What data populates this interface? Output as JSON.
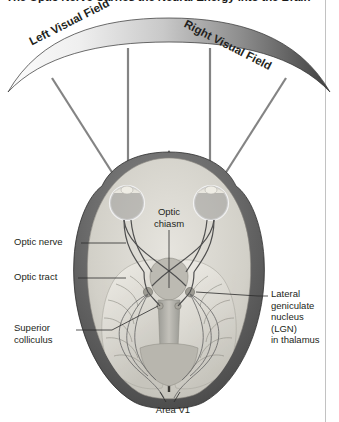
{
  "title": "The Optic Nerve Carries the Neural Energy into the Brain",
  "colors": {
    "text": "#231f20",
    "title": "#1a1a1a",
    "rule": "#c2c2c2",
    "head_outer_dark": "#4b4b4b",
    "head_outer_mid": "#6e6e6e",
    "skull_light": "#d8d8d6",
    "brain_tissue": "#cfcdc6",
    "brain_white": "#e9e7e1",
    "field_light": "#f2f2f2",
    "field_dark": "#4a4a4a",
    "leader": "#2b2b2b",
    "pathway": "#5d5d5d"
  },
  "figure": {
    "visual_fields": {
      "left_label": "Left Visual Field",
      "right_label": "Right Visual Field"
    },
    "labels": {
      "optic_nerve": "Optic nerve",
      "optic_tract": "Optic tract",
      "superior_colliculus": "Superior\ncolliculus",
      "superior_colliculus_line1": "Superior",
      "superior_colliculus_line2": "colliculus",
      "optic_chiasm_line1": "Optic",
      "optic_chiasm_line2": "chiasm",
      "lgn_line1": "Lateral",
      "lgn_line2": "geniculate",
      "lgn_line3": "nucleus",
      "lgn_line4": "(LGN)",
      "lgn_line5": "in thalamus",
      "area_v1": "Area V1"
    },
    "structures": [
      "left eye",
      "right eye",
      "optic nerve",
      "optic chiasm",
      "optic tract",
      "lateral geniculate nucleus",
      "superior colliculus",
      "optic radiations",
      "primary visual cortex (Area V1)"
    ]
  }
}
